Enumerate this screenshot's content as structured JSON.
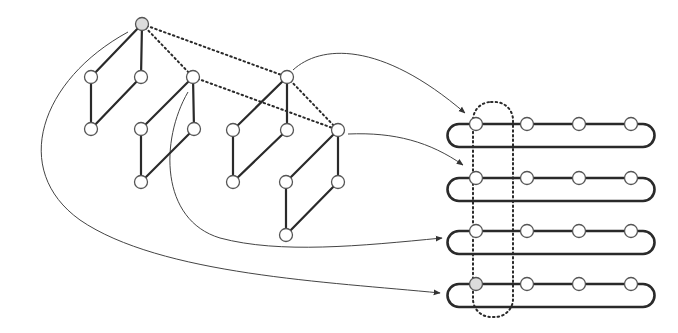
{
  "diagram": {
    "title": "",
    "colors": {
      "edge": "#2a2a2a",
      "node_stroke": "#555555",
      "node_fill": "#ffffff",
      "node_shaded": "#dcdcdc",
      "arrow": "#444444"
    },
    "root_node": {
      "x": 142,
      "y": 24,
      "shaded": true
    },
    "groups": [
      {
        "id": "g1",
        "top": [
          142,
          24
        ],
        "left": [
          91,
          77
        ],
        "right": [
          141,
          77
        ],
        "bottom": [
          91,
          129
        ]
      },
      {
        "id": "g2",
        "top": [
          193,
          77
        ],
        "left": [
          141,
          129
        ],
        "right": [
          194,
          129
        ],
        "bottom": [
          141,
          182
        ]
      },
      {
        "id": "g3",
        "top": [
          287,
          77
        ],
        "left": [
          233,
          130
        ],
        "right": [
          287,
          130
        ],
        "bottom": [
          233,
          182
        ]
      },
      {
        "id": "g4",
        "top": [
          338,
          130
        ],
        "left": [
          286,
          182
        ],
        "right": [
          338,
          182
        ],
        "bottom": [
          286,
          235
        ]
      }
    ],
    "dotted_links": [
      {
        "from": [
          142,
          24
        ],
        "to": [
          193,
          77
        ]
      },
      {
        "from": [
          142,
          24
        ],
        "to": [
          287,
          77
        ]
      },
      {
        "from": [
          193,
          77
        ],
        "to": [
          338,
          130
        ]
      },
      {
        "from": [
          287,
          77
        ],
        "to": [
          338,
          130
        ]
      }
    ],
    "rings": [
      {
        "y_top": 124,
        "y_bottom": 147,
        "nodes_x": [
          476,
          527,
          579,
          631
        ],
        "first_shaded": false
      },
      {
        "y_top": 178,
        "y_bottom": 201,
        "nodes_x": [
          476,
          527,
          579,
          631
        ],
        "first_shaded": false
      },
      {
        "y_top": 231,
        "y_bottom": 254,
        "nodes_x": [
          476,
          527,
          579,
          631
        ],
        "first_shaded": false
      },
      {
        "y_top": 284,
        "y_bottom": 307,
        "nodes_x": [
          476,
          527,
          579,
          631
        ],
        "first_shaded": true
      }
    ],
    "selection_box": {
      "x": 473,
      "y": 102,
      "width": 40,
      "height": 215,
      "style": "dotted-rounded"
    },
    "arrows": [
      {
        "from": "g3.top",
        "to": "ring1",
        "label": ""
      },
      {
        "from": "g4.top",
        "to": "ring2",
        "label": ""
      },
      {
        "from": "g2.top",
        "to": "ring3",
        "label": ""
      },
      {
        "from": "root",
        "to": "ring4",
        "label": ""
      }
    ]
  }
}
